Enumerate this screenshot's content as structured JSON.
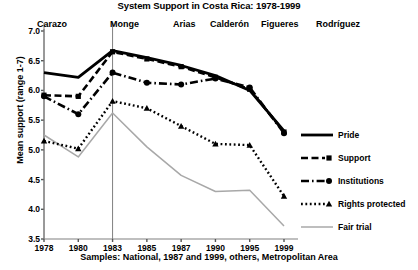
{
  "chart_data": {
    "type": "line",
    "title": "System Support in Costa Rica: 1978-1999",
    "xlabel": "",
    "ylabel": "Mean support (range 1-7)",
    "footnote": "Samples: National, 1987 and 1999, others, Metropolitan Area",
    "categories": [
      "1978",
      "1980",
      "1983",
      "1985",
      "1987",
      "1990",
      "1995",
      "1999"
    ],
    "x": [
      1978,
      1980,
      1983,
      1985,
      1987,
      1990,
      1995,
      1999
    ],
    "ylim": [
      3.5,
      7.0
    ],
    "yticks": [
      "7.0",
      "6.5",
      "6.0",
      "5.5",
      "5.0",
      "4.5",
      "4.0",
      "3.5"
    ],
    "ytick_values": [
      7.0,
      6.5,
      6.0,
      5.5,
      5.0,
      4.5,
      4.0,
      3.5
    ],
    "grid": false,
    "legend_position": "right",
    "series": [
      {
        "name": "Pride",
        "values": [
          6.3,
          6.22,
          6.67,
          6.55,
          6.42,
          6.25,
          6.0,
          5.32
        ],
        "style": "solid-thick",
        "marker": "none",
        "color": "#000000"
      },
      {
        "name": "Support",
        "values": [
          5.92,
          5.9,
          6.65,
          6.53,
          6.4,
          6.22,
          6.02,
          5.3
        ],
        "style": "dashed",
        "marker": "square",
        "color": "#000000"
      },
      {
        "name": "Institutions",
        "values": [
          5.9,
          5.6,
          6.3,
          6.13,
          6.1,
          6.2,
          6.05,
          5.28
        ],
        "style": "dash-dot",
        "marker": "circle",
        "color": "#000000"
      },
      {
        "name": "Rights protected",
        "values": [
          5.15,
          5.02,
          5.82,
          5.7,
          5.4,
          5.1,
          5.08,
          4.22
        ],
        "style": "dotted",
        "marker": "triangle",
        "color": "#000000"
      },
      {
        "name": "Fair trial",
        "values": [
          5.25,
          4.88,
          5.62,
          5.05,
          4.57,
          4.3,
          4.32,
          3.72
        ],
        "style": "solid-thin-gray",
        "marker": "none",
        "color": "#a8a8a8"
      }
    ],
    "presidents": [
      {
        "label": "Carazo",
        "left": 37
      },
      {
        "label": "Monge",
        "left": 110
      },
      {
        "label": "Arias",
        "left": 173
      },
      {
        "label": "Calderón",
        "left": 210
      },
      {
        "label": "Figueres",
        "left": 261
      },
      {
        "label": "Rodríguez",
        "left": 316
      }
    ],
    "president_dividers": [
      1978,
      1983
    ],
    "legend_entries": [
      "Pride",
      "Support",
      "Institutions",
      "Rights protected",
      "Fair trial"
    ]
  }
}
